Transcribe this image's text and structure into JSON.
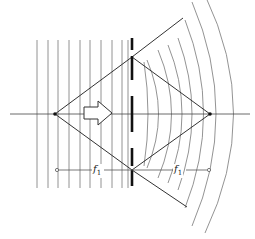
{
  "diagram": {
    "type": "optics-lens-focusing",
    "labels": {
      "left_focal_length": "f",
      "left_focal_sub": "1",
      "right_focal_length": "f",
      "right_focal_sub": "1"
    },
    "colors": {
      "line": "#333333",
      "lens": "#111111",
      "background": "#ffffff"
    },
    "geometry": {
      "axis_y": 114,
      "lens_x": 132,
      "left_focus": [
        55,
        114
      ],
      "right_focus": [
        210,
        114
      ],
      "diamond_top": [
        132,
        57
      ],
      "diamond_bottom": [
        132,
        170
      ],
      "plane_wave_x": [
        37,
        48,
        58,
        69,
        80,
        90,
        101,
        112,
        122,
        133,
        143
      ],
      "plane_wave_y_range": [
        40,
        188
      ]
    }
  }
}
